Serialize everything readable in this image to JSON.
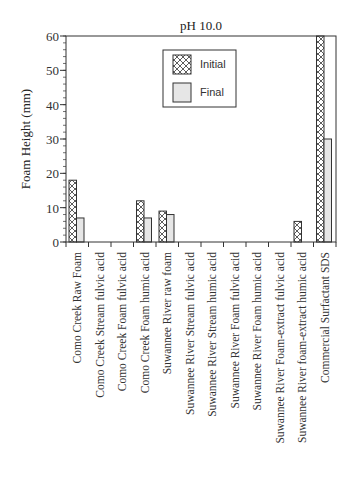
{
  "chart_data": {
    "type": "bar",
    "title": "pH 10.0",
    "xlabel": "",
    "ylabel": "Foam Height (mm)",
    "ylim": [
      0,
      60
    ],
    "yticks": [
      0,
      10,
      20,
      30,
      40,
      50,
      60
    ],
    "yminor_step": 2,
    "grid": false,
    "legend_position": "top-center",
    "categories": [
      "Como Creek Raw Foam",
      "Como Creek Stream fulvic acid",
      "Como Creek Foam fulvic acid",
      "Como Creek Foam humic acid",
      "Suwannee River raw foam",
      "Suwannee River Stream fulvic acid",
      "Suwannee River Stream humic acid",
      "Suwannee River Foam fulvic acid",
      "Suwannee River Foam humic acid",
      "Suwannee River Foam-extract fulvic acid",
      "Suwannee River foam-extract humic acid",
      "Commercial Surfactant SDS"
    ],
    "series": [
      {
        "name": "Initial",
        "pattern": "crosshatch",
        "values": [
          18,
          0,
          0,
          12,
          9,
          0,
          0,
          0,
          0,
          0,
          6,
          60
        ]
      },
      {
        "name": "Final",
        "pattern": "light-gray",
        "values": [
          7,
          0,
          0,
          7,
          8,
          0,
          0,
          0,
          0,
          0,
          0,
          30
        ]
      }
    ]
  },
  "colors": {
    "axis": "#333333",
    "final_fill": "#e6e6e6",
    "initial_fill": "#ffffff"
  }
}
